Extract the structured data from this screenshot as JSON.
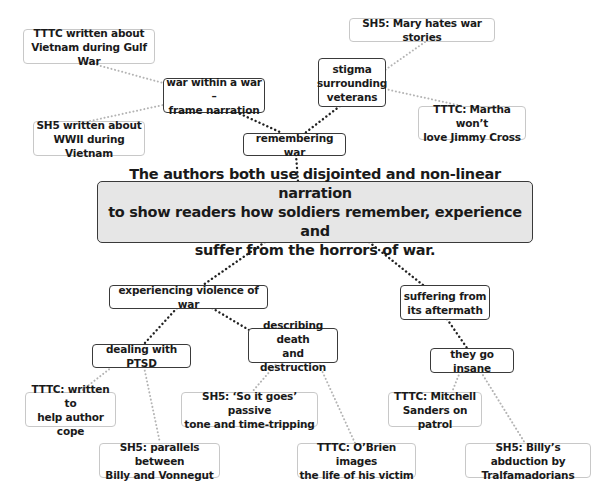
{
  "diagram": {
    "type": "mind-map",
    "central": {
      "text": "The authors both use disjointed and non-linear narration\nto show readers how soldiers remember, experience and\nsuffer from the horrors of war."
    },
    "branches": [
      {
        "id": "remembering",
        "text": "remembering war",
        "children": [
          {
            "id": "frame",
            "text": "war within a war –\nframe narration",
            "leaves": [
              {
                "id": "leaf-tttc-gulf",
                "text": "TTTC written about\nVietnam during Gulf War"
              },
              {
                "id": "leaf-sh5-wwii",
                "text": "SH5 written about\nWWII during Vietnam"
              }
            ]
          },
          {
            "id": "stigma",
            "text": "stigma\nsurrounding\nveterans",
            "leaves": [
              {
                "id": "leaf-sh5-mary",
                "text": "SH5: Mary hates war stories"
              },
              {
                "id": "leaf-tttc-martha",
                "text": "TTTC: Martha won’t\nlove Jimmy Cross"
              }
            ]
          }
        ]
      },
      {
        "id": "experiencing",
        "text": "experiencing violence of war",
        "children": [
          {
            "id": "ptsd",
            "text": "dealing with PTSD",
            "leaves": [
              {
                "id": "leaf-tttc-cope",
                "text": "TTTC: written to\nhelp author cope"
              },
              {
                "id": "leaf-sh5-parallels",
                "text": "SH5: parallels between\nBilly and Vonnegut"
              }
            ]
          },
          {
            "id": "death",
            "text": "describing death\nand destruction",
            "leaves": [
              {
                "id": "leaf-sh5-soitgoes",
                "text": "SH5: ‘So it goes’ passive\ntone and time-tripping"
              },
              {
                "id": "leaf-tttc-obrien",
                "text": "TTTC: O’Brien images\nthe life of his victim"
              }
            ]
          }
        ]
      },
      {
        "id": "suffering",
        "text": "suffering from\nits aftermath",
        "children": [
          {
            "id": "insane",
            "text": "they go insane",
            "leaves": [
              {
                "id": "leaf-tttc-mitchell",
                "text": "TTTC: Mitchell\nSanders on patrol"
              },
              {
                "id": "leaf-sh5-billy",
                "text": "SH5: Billy’s abduction by\nTralfamadorians"
              }
            ]
          }
        ]
      }
    ]
  },
  "colors": {
    "central_fill": "#e6e6e6",
    "branch_border": "#3a3a3a",
    "leaf_border": "#c8c8c8",
    "strong_link": "#222222",
    "weak_link": "#b4b4b4"
  }
}
